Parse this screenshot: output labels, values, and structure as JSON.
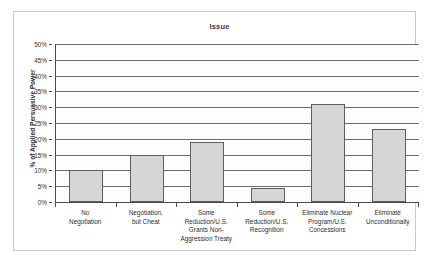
{
  "chart_data": {
    "type": "bar",
    "title": "Issue",
    "xlabel": "",
    "ylabel": "% of Applied Persuasive Power",
    "ylim": [
      0,
      50
    ],
    "grid": true,
    "legend": "none",
    "categories": [
      "No Negotiation",
      "Negotiation, but Cheat",
      "Some Reduction/U.S. Grants Non-Aggression Treaty",
      "Some Reduction/U.S. Recognition",
      "Eliminate Nuclear Program/U.S. Concessions",
      "Eliminate Unconditionally"
    ],
    "category_lines": [
      [
        "No",
        "Negotiation"
      ],
      [
        "Negotiation,",
        "but Cheat"
      ],
      [
        "Some",
        "Reduction/U.S.",
        "Grants Non-",
        "Aggression Treaty"
      ],
      [
        "Some",
        "Reduction/U.S.",
        "Recognition"
      ],
      [
        "Eliminate Nuclear",
        "Program/U.S.",
        "Concessions"
      ],
      [
        "Eliminate",
        "Unconditionally"
      ]
    ],
    "values": [
      10,
      15,
      19,
      4.5,
      31,
      23
    ],
    "ytick_labels": [
      "50%",
      "45%",
      "40%",
      "35%",
      "30%",
      "25%",
      "20%",
      "15%",
      "10%",
      "5%",
      "0%"
    ],
    "ytick_values": [
      50,
      45,
      40,
      35,
      30,
      25,
      20,
      15,
      10,
      5,
      0
    ],
    "bar_fill_color": "#d6d6d6",
    "bar_border_color": "#5f5f5f",
    "gridline_color": "#6d6d6d",
    "axis_color": "#4a4a4a",
    "plot_background": "#fdfdfd",
    "frame_color": "#c9c9c9"
  }
}
